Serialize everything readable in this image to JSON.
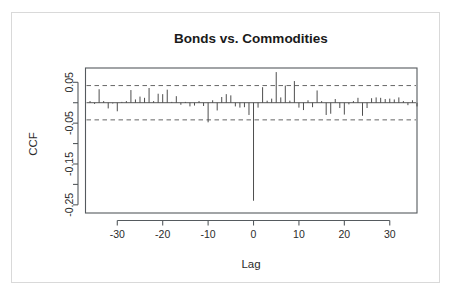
{
  "chart_data": {
    "type": "bar",
    "title": "Bonds vs. Commodities",
    "xlabel": "Lag",
    "ylabel": "CCF",
    "grid": false,
    "legend": "none",
    "xlim": [
      -37,
      36
    ],
    "ylim": [
      -0.27,
      0.085
    ],
    "xticks": [
      -30,
      -20,
      -10,
      0,
      10,
      20,
      30
    ],
    "xtick_labels": [
      "-30",
      "-20",
      "-10",
      "0",
      "10",
      "20",
      "30"
    ],
    "yticks": [
      0.05,
      -0.05,
      -0.15,
      -0.25
    ],
    "ytick_labels": [
      "0.05",
      "-0.05",
      "-0.15",
      "-0.25"
    ],
    "yminorticks": [
      0.0,
      -0.1,
      -0.2
    ],
    "confidence_bands": [
      0.042,
      -0.042
    ],
    "zero_reference": 0.0,
    "x": [
      -36,
      -35,
      -34,
      -33,
      -32,
      -31,
      -30,
      -29,
      -28,
      -27,
      -26,
      -25,
      -24,
      -23,
      -22,
      -21,
      -20,
      -19,
      -18,
      -17,
      -16,
      -15,
      -14,
      -13,
      -12,
      -11,
      -10,
      -9,
      -8,
      -7,
      -6,
      -5,
      -4,
      -3,
      -2,
      -1,
      0,
      1,
      2,
      3,
      4,
      5,
      6,
      7,
      8,
      9,
      10,
      11,
      12,
      13,
      14,
      15,
      16,
      17,
      18,
      19,
      20,
      21,
      22,
      23,
      24,
      25,
      26,
      27,
      28,
      29,
      30,
      31,
      32,
      33,
      34,
      35,
      36
    ],
    "values": [
      0.004,
      -0.003,
      0.033,
      0.004,
      -0.014,
      -0.002,
      -0.021,
      0.002,
      0.004,
      0.031,
      0.008,
      0.015,
      0.012,
      0.036,
      0.004,
      0.022,
      0.021,
      0.032,
      0.002,
      0.016,
      -0.005,
      0.002,
      -0.009,
      -0.007,
      0.004,
      -0.008,
      -0.048,
      0.006,
      -0.019,
      0.014,
      0.021,
      0.018,
      -0.009,
      -0.012,
      -0.011,
      -0.03,
      -0.24,
      -0.012,
      0.038,
      0.005,
      0.01,
      0.075,
      0.013,
      0.042,
      0.005,
      0.053,
      -0.012,
      -0.018,
      0.006,
      -0.011,
      0.03,
      0.004,
      -0.03,
      -0.027,
      0.009,
      -0.013,
      -0.029,
      -0.004,
      0.004,
      0.012,
      -0.032,
      -0.013,
      0.011,
      0.013,
      0.012,
      0.009,
      0.01,
      0.008,
      0.013,
      0.004,
      -0.006,
      0.006,
      -0.009
    ]
  },
  "chart": {
    "title": "Bonds vs. Commodities",
    "ylabel": "CCF",
    "xlabel": "Lag"
  }
}
